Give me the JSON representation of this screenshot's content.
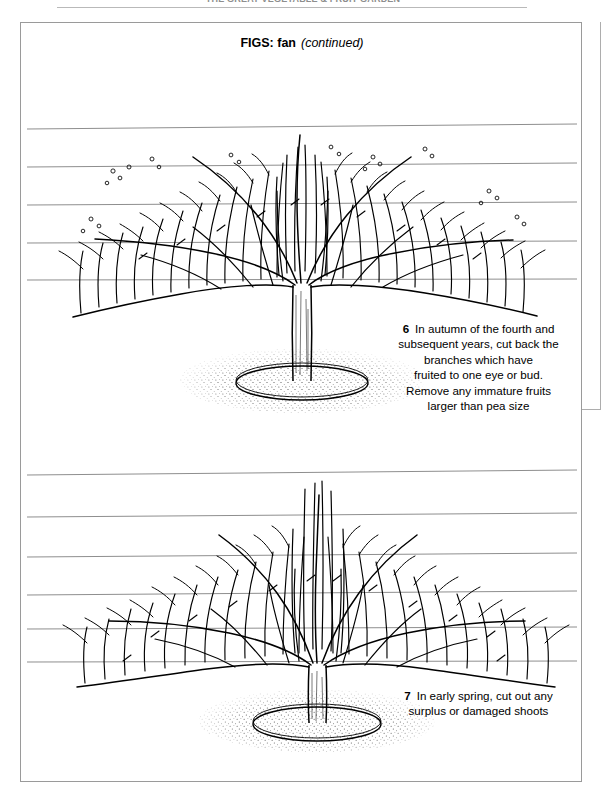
{
  "running_head": {
    "text": "THE GREAT VEGETABLE & FRUIT GARDEN"
  },
  "panel": {
    "title_main": "FIGS: fan",
    "title_sub": "(continued)"
  },
  "figures": [
    {
      "id": "figure-6",
      "name": "fan-trained-fig-tree-autumn",
      "caption_number": "6",
      "caption_lines": [
        "In autumn of the fourth and",
        "subsequent years, cut back the",
        "branches which have",
        "fruited to one eye or bud.",
        "Remove any immature fruits",
        "larger than pea size"
      ],
      "wire_count": 5,
      "has_ground_stipple": true,
      "has_trunk": true
    },
    {
      "id": "figure-7",
      "name": "fan-trained-fig-tree-spring",
      "caption_number": "7",
      "caption_lines": [
        "In early spring, cut out any",
        "surplus or damaged shoots"
      ],
      "wire_count": 6,
      "has_ground_stipple": true,
      "has_trunk": true
    }
  ],
  "colors": {
    "ink": "#000000",
    "wire": "#8d8d8d",
    "border": "#9a9a9a",
    "page": "#ffffff"
  }
}
